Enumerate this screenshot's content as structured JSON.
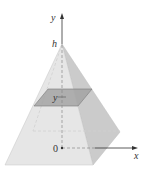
{
  "diagram": {
    "labels": {
      "y_axis": "y",
      "x_axis": "x",
      "apex": "h",
      "origin": "0",
      "cross_section": "y"
    },
    "colors": {
      "front_face": "#e4e4e4",
      "right_face": "#c9c9c9",
      "cross_section": "#9e9e9e",
      "axis": "#333333",
      "edge": "#b0b0b0"
    }
  }
}
